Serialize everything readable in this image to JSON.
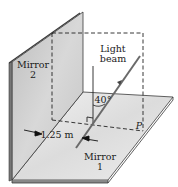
{
  "figure": {
    "mirror2_label_line1": "Mirror",
    "mirror2_label_line2": "2",
    "mirror1_label_line1": "Mirror",
    "mirror1_label_line2": "1",
    "beam_label_line1": "Light",
    "beam_label_line2": "beam",
    "angle_label": "40°",
    "distance_label": "1.25 m",
    "point_label": "P"
  },
  "colors": {
    "mirror_face": "#c9c9c9",
    "floor_face": "#e6e6e6",
    "edge": "#3a3a3a",
    "beam": "#6a6a6a"
  }
}
